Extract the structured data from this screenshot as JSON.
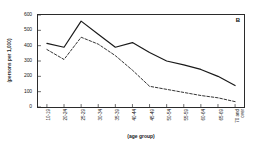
{
  "chart_data": {
    "type": "line",
    "title": "",
    "panel_label": "B",
    "xlabel": "(age group)",
    "ylabel": "(persons per 1,000)",
    "categories": [
      "10-19",
      "20-24",
      "25-29",
      "30-34",
      "35-39",
      "40-44",
      "45-49",
      "50-54",
      "55-59",
      "60-64",
      "65-69",
      "70 and over"
    ],
    "ylim": [
      0,
      600
    ],
    "yticks": [
      0,
      100,
      200,
      300,
      400,
      500,
      600
    ],
    "ytick_labels": [
      "0",
      "100",
      "200",
      "300",
      "400",
      "500",
      "600"
    ],
    "grid": false,
    "legend_position": "none",
    "series": [
      {
        "name": "solid-series",
        "style": "solid",
        "color": "#1a1a1a",
        "values": [
          415,
          390,
          560,
          475,
          390,
          420,
          355,
          300,
          275,
          245,
          200,
          140
        ]
      },
      {
        "name": "dashed-series",
        "style": "dashed",
        "color": "#1a1a1a",
        "values": [
          375,
          310,
          455,
          410,
          335,
          240,
          135,
          115,
          95,
          75,
          60,
          35
        ]
      }
    ]
  }
}
